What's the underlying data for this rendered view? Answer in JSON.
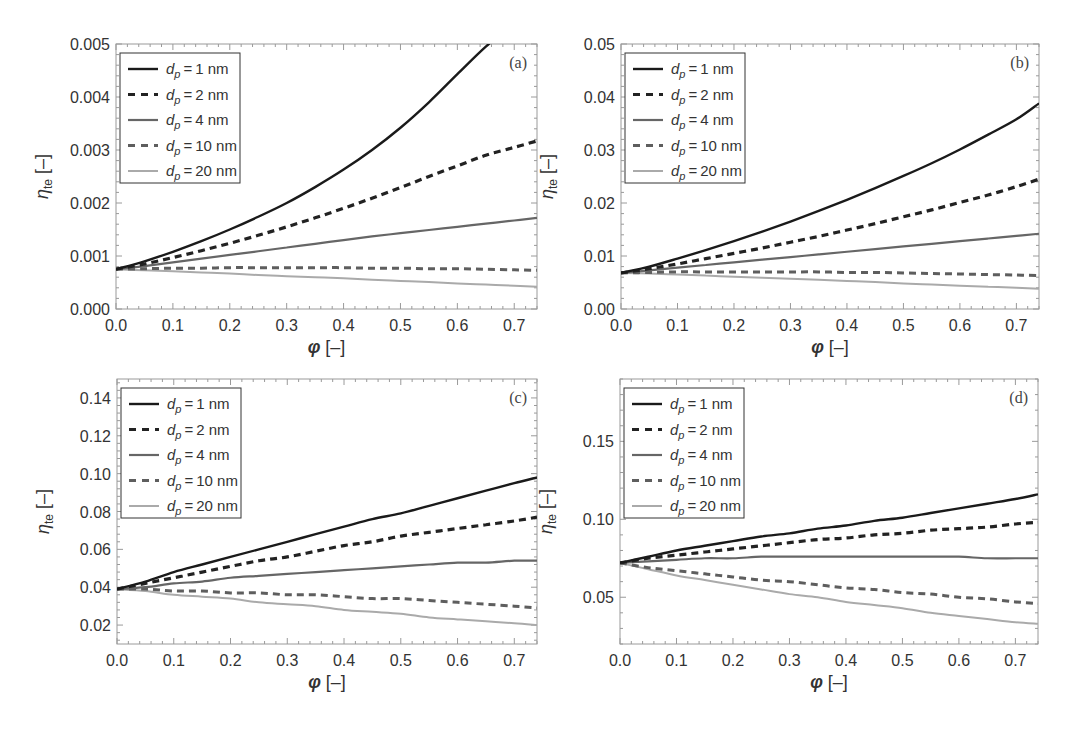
{
  "figure": {
    "legend_entries": [
      "d_p = 1 nm",
      "d_p = 2 nm",
      "d_p = 4 nm",
      "d_p = 10 nm",
      "d_p = 20 nm"
    ],
    "series_styles": [
      {
        "name": "d_p = 1 nm",
        "color": "#1a1a1a",
        "dash": "",
        "width": 2.4
      },
      {
        "name": "d_p = 2 nm",
        "color": "#222222",
        "dash": "7,5",
        "width": 3.2
      },
      {
        "name": "d_p = 4 nm",
        "color": "#666666",
        "dash": "",
        "width": 2.2
      },
      {
        "name": "d_p = 10 nm",
        "color": "#5e5e5e",
        "dash": "7,5",
        "width": 3.0
      },
      {
        "name": "d_p = 20 nm",
        "color": "#aaaaaa",
        "dash": "",
        "width": 2.0
      }
    ],
    "frame_color": "#9a9a9a",
    "tick_label_color": "#333333"
  },
  "chart_data": [
    {
      "type": "line",
      "panel_label": "(a)",
      "title": "",
      "xlabel": "φ [–]",
      "ylabel": "η_te [–]",
      "xlim": [
        0,
        0.74
      ],
      "ylim": [
        0,
        0.005
      ],
      "xticks": [
        "0.0",
        "0.1",
        "0.2",
        "0.3",
        "0.4",
        "0.5",
        "0.6",
        "0.7"
      ],
      "yticks": [
        "0.000",
        "0.001",
        "0.002",
        "0.003",
        "0.004",
        "0.005"
      ],
      "ytick_values": [
        0,
        0.001,
        0.002,
        0.003,
        0.004,
        0.005
      ],
      "grid": false,
      "legend_position": "upper left",
      "x": [
        0,
        0.05,
        0.1,
        0.15,
        0.2,
        0.25,
        0.3,
        0.35,
        0.4,
        0.45,
        0.5,
        0.55,
        0.6,
        0.65,
        0.7,
        0.74
      ],
      "series": [
        {
          "name": "d_p = 1 nm",
          "values": [
            0.00075,
            0.0009,
            0.00108,
            0.00128,
            0.0015,
            0.00174,
            0.002,
            0.0023,
            0.00263,
            0.003,
            0.00342,
            0.0039,
            0.00443,
            0.00495,
            0.0054,
            0.0058
          ]
        },
        {
          "name": "d_p = 2 nm",
          "values": [
            0.00075,
            0.00085,
            0.00097,
            0.0011,
            0.00124,
            0.00139,
            0.00155,
            0.00172,
            0.0019,
            0.00209,
            0.00229,
            0.0025,
            0.0027,
            0.0029,
            0.00305,
            0.00317
          ]
        },
        {
          "name": "d_p = 4 nm",
          "values": [
            0.00075,
            0.00081,
            0.00088,
            0.00095,
            0.00102,
            0.00109,
            0.00116,
            0.00123,
            0.0013,
            0.00137,
            0.00143,
            0.00149,
            0.00155,
            0.00161,
            0.00167,
            0.00172
          ]
        },
        {
          "name": "d_p = 10 nm",
          "values": [
            0.00075,
            0.00076,
            0.00077,
            0.00077,
            0.00078,
            0.00078,
            0.00078,
            0.00078,
            0.00078,
            0.00077,
            0.00077,
            0.00076,
            0.00076,
            0.00075,
            0.00074,
            0.00073
          ]
        },
        {
          "name": "d_p = 20 nm",
          "values": [
            0.00075,
            0.00073,
            0.00071,
            0.00069,
            0.00067,
            0.00064,
            0.00062,
            0.0006,
            0.00058,
            0.00055,
            0.00053,
            0.00051,
            0.00048,
            0.00046,
            0.00044,
            0.00042
          ]
        }
      ]
    },
    {
      "type": "line",
      "panel_label": "(b)",
      "title": "",
      "xlabel": "φ [–]",
      "ylabel": "η_te [–]",
      "xlim": [
        0,
        0.74
      ],
      "ylim": [
        0,
        0.05
      ],
      "xticks": [
        "0.0",
        "0.1",
        "0.2",
        "0.3",
        "0.4",
        "0.5",
        "0.6",
        "0.7"
      ],
      "yticks": [
        "0.00",
        "0.01",
        "0.02",
        "0.03",
        "0.04",
        "0.05"
      ],
      "ytick_values": [
        0,
        0.01,
        0.02,
        0.03,
        0.04,
        0.05
      ],
      "grid": false,
      "legend_position": "upper left",
      "x": [
        0,
        0.05,
        0.1,
        0.15,
        0.2,
        0.25,
        0.3,
        0.35,
        0.4,
        0.45,
        0.5,
        0.55,
        0.6,
        0.65,
        0.7,
        0.74
      ],
      "series": [
        {
          "name": "d_p = 1 nm",
          "values": [
            0.0068,
            0.008,
            0.0095,
            0.0111,
            0.0128,
            0.0146,
            0.0165,
            0.0185,
            0.0206,
            0.0228,
            0.0251,
            0.0275,
            0.0301,
            0.0329,
            0.0358,
            0.0388
          ]
        },
        {
          "name": "d_p = 2 nm",
          "values": [
            0.0068,
            0.0076,
            0.0085,
            0.0095,
            0.0105,
            0.0115,
            0.0126,
            0.0137,
            0.0149,
            0.0161,
            0.0174,
            0.0187,
            0.0201,
            0.0215,
            0.0231,
            0.0245
          ]
        },
        {
          "name": "d_p = 4 nm",
          "values": [
            0.0068,
            0.0073,
            0.0078,
            0.0083,
            0.0088,
            0.0093,
            0.0098,
            0.0103,
            0.0108,
            0.0113,
            0.0118,
            0.0123,
            0.0128,
            0.0133,
            0.0138,
            0.0142
          ]
        },
        {
          "name": "d_p = 10 nm",
          "values": [
            0.0068,
            0.0069,
            0.007,
            0.007,
            0.007,
            0.007,
            0.007,
            0.007,
            0.0069,
            0.0069,
            0.0068,
            0.0067,
            0.0066,
            0.0065,
            0.0064,
            0.0063
          ]
        },
        {
          "name": "d_p = 20 nm",
          "values": [
            0.0068,
            0.0067,
            0.0065,
            0.0063,
            0.0061,
            0.0059,
            0.0057,
            0.0055,
            0.0053,
            0.0051,
            0.0048,
            0.0046,
            0.0044,
            0.0042,
            0.004,
            0.0038
          ]
        }
      ]
    },
    {
      "type": "line",
      "panel_label": "(c)",
      "title": "",
      "xlabel": "φ [–]",
      "ylabel": "η_te [–]",
      "xlim": [
        0,
        0.74
      ],
      "ylim": [
        0.01,
        0.15
      ],
      "xticks": [
        "0.0",
        "0.1",
        "0.2",
        "0.3",
        "0.4",
        "0.5",
        "0.6",
        "0.7"
      ],
      "yticks": [
        "0.02",
        "0.04",
        "0.06",
        "0.08",
        "0.10",
        "0.12",
        "0.14"
      ],
      "ytick_values": [
        0.02,
        0.04,
        0.06,
        0.08,
        0.1,
        0.12,
        0.14
      ],
      "grid": false,
      "legend_position": "upper left",
      "x": [
        0,
        0.05,
        0.1,
        0.15,
        0.2,
        0.25,
        0.3,
        0.35,
        0.4,
        0.45,
        0.5,
        0.55,
        0.6,
        0.65,
        0.7,
        0.74
      ],
      "series": [
        {
          "name": "d_p = 1 nm",
          "values": [
            0.039,
            0.043,
            0.048,
            0.052,
            0.056,
            0.06,
            0.064,
            0.068,
            0.072,
            0.076,
            0.079,
            0.083,
            0.087,
            0.091,
            0.095,
            0.098
          ]
        },
        {
          "name": "d_p = 2 nm",
          "values": [
            0.039,
            0.042,
            0.045,
            0.048,
            0.051,
            0.054,
            0.056,
            0.059,
            0.062,
            0.064,
            0.067,
            0.069,
            0.071,
            0.073,
            0.075,
            0.077
          ]
        },
        {
          "name": "d_p = 4 nm",
          "values": [
            0.039,
            0.04,
            0.042,
            0.043,
            0.045,
            0.046,
            0.047,
            0.048,
            0.049,
            0.05,
            0.051,
            0.052,
            0.053,
            0.053,
            0.054,
            0.054
          ]
        },
        {
          "name": "d_p = 10 nm",
          "values": [
            0.039,
            0.039,
            0.038,
            0.038,
            0.037,
            0.037,
            0.036,
            0.036,
            0.035,
            0.034,
            0.034,
            0.033,
            0.032,
            0.031,
            0.03,
            0.029
          ]
        },
        {
          "name": "d_p = 20 nm",
          "values": [
            0.039,
            0.038,
            0.036,
            0.035,
            0.034,
            0.032,
            0.031,
            0.03,
            0.028,
            0.027,
            0.026,
            0.024,
            0.023,
            0.022,
            0.021,
            0.02
          ]
        }
      ]
    },
    {
      "type": "line",
      "panel_label": "(d)",
      "title": "",
      "xlabel": "φ [–]",
      "ylabel": "η_te [–]",
      "xlim": [
        0,
        0.74
      ],
      "ylim": [
        0.02,
        0.19
      ],
      "xticks": [
        "0.0",
        "0.1",
        "0.2",
        "0.3",
        "0.4",
        "0.5",
        "0.6",
        "0.7"
      ],
      "yticks": [
        "0.05",
        "0.10",
        "0.15"
      ],
      "ytick_values": [
        0.05,
        0.1,
        0.15
      ],
      "grid": false,
      "legend_position": "upper left",
      "x": [
        0,
        0.05,
        0.1,
        0.15,
        0.2,
        0.25,
        0.3,
        0.35,
        0.4,
        0.45,
        0.5,
        0.55,
        0.6,
        0.65,
        0.7,
        0.74
      ],
      "series": [
        {
          "name": "d_p = 1 nm",
          "values": [
            0.072,
            0.076,
            0.08,
            0.083,
            0.086,
            0.089,
            0.091,
            0.094,
            0.096,
            0.099,
            0.101,
            0.104,
            0.107,
            0.11,
            0.113,
            0.116
          ]
        },
        {
          "name": "d_p = 2 nm",
          "values": [
            0.072,
            0.075,
            0.077,
            0.079,
            0.081,
            0.083,
            0.085,
            0.087,
            0.088,
            0.09,
            0.091,
            0.093,
            0.094,
            0.095,
            0.097,
            0.098
          ]
        },
        {
          "name": "d_p = 4 nm",
          "values": [
            0.072,
            0.073,
            0.074,
            0.075,
            0.075,
            0.076,
            0.076,
            0.076,
            0.076,
            0.076,
            0.076,
            0.076,
            0.076,
            0.075,
            0.075,
            0.075
          ]
        },
        {
          "name": "d_p = 10 nm",
          "values": [
            0.072,
            0.069,
            0.067,
            0.065,
            0.063,
            0.061,
            0.06,
            0.058,
            0.056,
            0.055,
            0.053,
            0.052,
            0.05,
            0.049,
            0.047,
            0.046
          ]
        },
        {
          "name": "d_p = 20 nm",
          "values": [
            0.072,
            0.068,
            0.064,
            0.061,
            0.058,
            0.055,
            0.052,
            0.05,
            0.047,
            0.045,
            0.043,
            0.04,
            0.038,
            0.036,
            0.034,
            0.033
          ]
        }
      ]
    }
  ],
  "panels_layout": [
    {
      "left": 116,
      "top": 44,
      "right": 537,
      "bottom": 309,
      "legend_width": 120
    },
    {
      "left": 621,
      "top": 44,
      "right": 1039,
      "bottom": 309,
      "legend_width": 120
    },
    {
      "left": 117,
      "top": 379,
      "right": 537,
      "bottom": 644,
      "legend_width": 120
    },
    {
      "left": 620,
      "top": 379,
      "right": 1038,
      "bottom": 644,
      "legend_width": 120
    }
  ]
}
